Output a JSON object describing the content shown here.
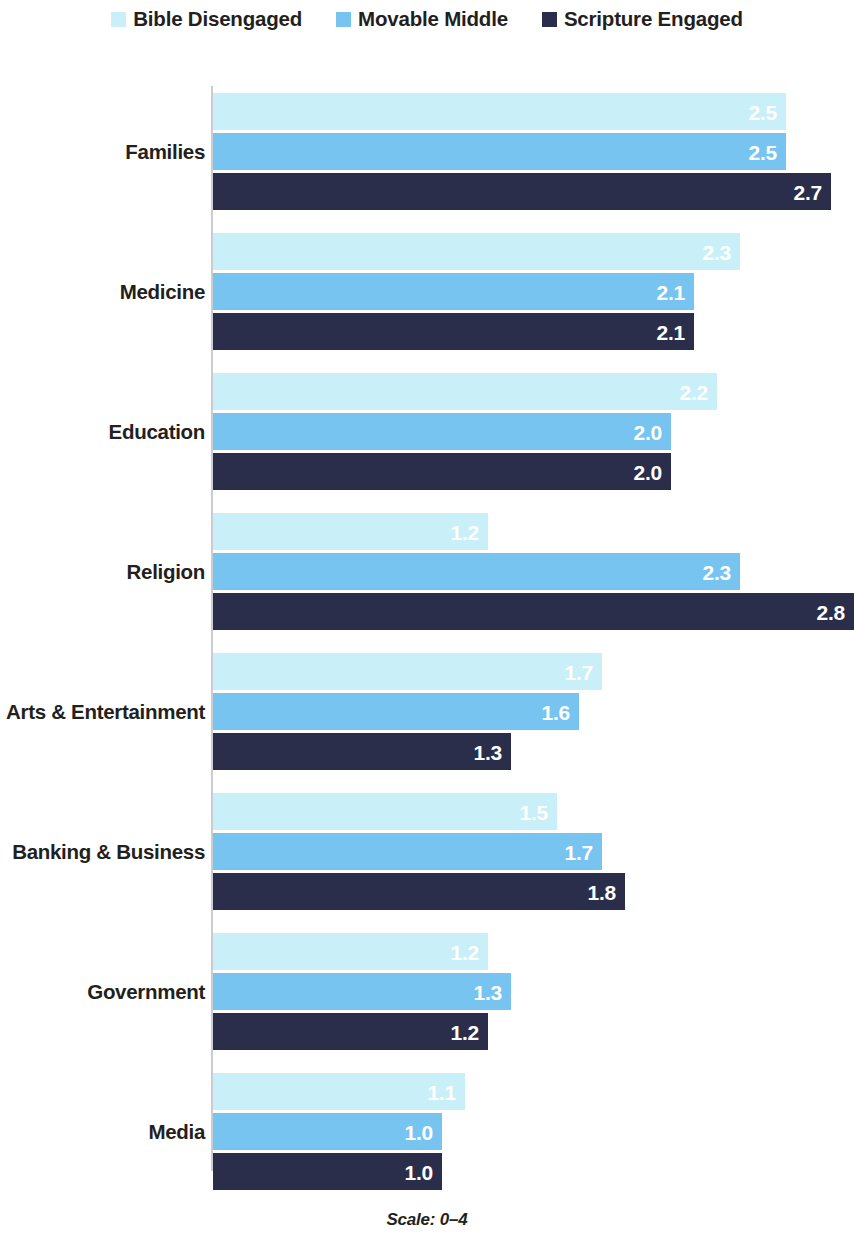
{
  "legend": {
    "items": [
      {
        "label": "Bible Disengaged",
        "color": "#c9eff9",
        "swatch_name": "legend-swatch-bible-disengaged"
      },
      {
        "label": "Movable Middle",
        "color": "#76c4ef",
        "swatch_name": "legend-swatch-movable-middle"
      },
      {
        "label": "Scripture Engaged",
        "color": "#2b2e4a",
        "swatch_name": "legend-swatch-scripture-engaged"
      }
    ]
  },
  "footer": {
    "note": "Scale: 0–4"
  },
  "chart_data": {
    "type": "bar",
    "orientation": "horizontal",
    "title": "",
    "subtitle": "",
    "xlabel": "",
    "ylabel": "",
    "xlim": [
      0,
      4
    ],
    "scale_note": "Scale: 0–4",
    "grid": false,
    "legend_position": "top-center",
    "axis_line_color": "#c9cdd2",
    "categories": [
      "Families",
      "Medicine",
      "Education",
      "Religion",
      "Arts & Entertainment",
      "Banking & Business",
      "Government",
      "Media"
    ],
    "series": [
      {
        "name": "Bible Disengaged",
        "color": "#c9eff9",
        "label_color": "#ffffff",
        "values": [
          2.5,
          2.3,
          2.2,
          1.2,
          1.7,
          1.5,
          1.2,
          1.1
        ],
        "value_labels": [
          "2.5",
          "2.3",
          "2.2",
          "1.2",
          "1.7",
          "1.5",
          "1.2",
          "1.1"
        ]
      },
      {
        "name": "Movable Middle",
        "color": "#76c4ef",
        "label_color": "#ffffff",
        "values": [
          2.5,
          2.1,
          2.0,
          2.3,
          1.6,
          1.7,
          1.3,
          1.0
        ],
        "value_labels": [
          "2.5",
          "2.1",
          "2.0",
          "2.3",
          "1.6",
          "1.7",
          "1.3",
          "1.0"
        ]
      },
      {
        "name": "Scripture Engaged",
        "color": "#2b2e4a",
        "label_color": "#ffffff",
        "values": [
          2.7,
          2.1,
          2.0,
          2.8,
          1.3,
          1.8,
          1.2,
          1.0
        ],
        "value_labels": [
          "2.7",
          "2.1",
          "2.0",
          "2.8",
          "1.3",
          "1.8",
          "1.2",
          "1.0"
        ]
      }
    ]
  }
}
